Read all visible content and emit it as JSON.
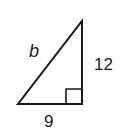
{
  "diagram": {
    "type": "right-triangle",
    "labels": {
      "hypotenuse": "b",
      "vertical_leg": "12",
      "horizontal_leg": "9"
    },
    "right_angle_marker": true,
    "stroke_color": "#1a1a1a"
  }
}
